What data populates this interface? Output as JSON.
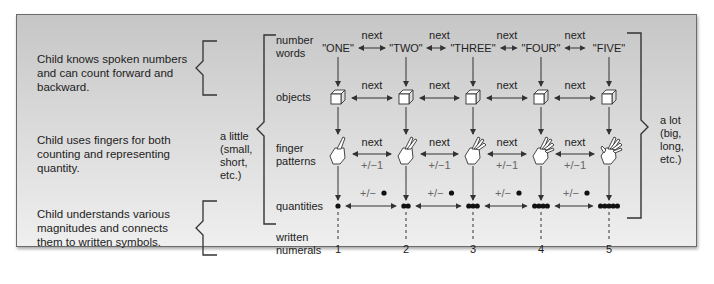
{
  "descriptions": [
    {
      "lines": [
        "Child knows spoken numbers",
        "and can count forward and",
        "backward."
      ]
    },
    {
      "lines": [
        "Child uses fingers for both",
        "counting and representing",
        "quantity."
      ]
    },
    {
      "lines": [
        "Child understands various",
        "magnitudes and connects",
        "them to written symbols."
      ]
    }
  ],
  "left_scale": {
    "lines": [
      "a little",
      "(small,",
      "short,",
      "etc.)"
    ]
  },
  "right_scale": {
    "lines": [
      "a lot",
      "(big,",
      "long,",
      "etc.)"
    ]
  },
  "row_labels": {
    "number_words": [
      "number",
      "words"
    ],
    "objects": [
      "objects"
    ],
    "finger_patterns": [
      "finger",
      "patterns"
    ],
    "quantities": [
      "quantities"
    ],
    "written_numerals": [
      "written",
      "numerals"
    ]
  },
  "number_words": [
    "\"ONE\"",
    "\"TWO\"",
    "\"THREE\"",
    "\"FOUR\"",
    "\"FIVE\""
  ],
  "quantities": [
    1,
    2,
    3,
    4,
    5
  ],
  "numerals": [
    "1",
    "2",
    "3",
    "4",
    "5"
  ],
  "relations": {
    "next": "next",
    "plus_minus_one": "+/−1",
    "plus_minus_dot": "+/−"
  },
  "icons": {
    "object": "cube-icon",
    "finger": "hand-icon",
    "quantity": "dot-icon"
  }
}
